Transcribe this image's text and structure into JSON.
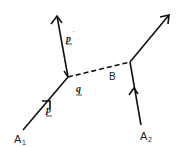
{
  "diagram": {
    "labels": {
      "a1": "A",
      "a1_sub": "1",
      "a2": "A",
      "a2_sub": "2",
      "b": "B",
      "p_prime": "p",
      "p_prime_mark": "′",
      "q": "q",
      "p": "p"
    },
    "colors": {
      "line": "#111111",
      "background": "#ffffff"
    }
  }
}
